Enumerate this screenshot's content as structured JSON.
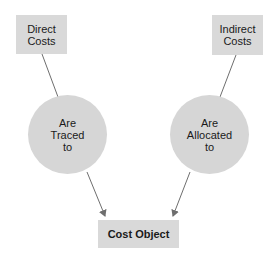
{
  "diagram": {
    "nodes": {
      "direct_costs": "Direct\nCosts",
      "indirect_costs": "Indirect\nCosts",
      "traced": "Are\nTraced\nto",
      "allocated": "Are\nAllocated\nto",
      "cost_object": "Cost Object"
    },
    "edges": [
      {
        "from": "Direct Costs",
        "via": "Are Traced to",
        "to": "Cost Object"
      },
      {
        "from": "Indirect Costs",
        "via": "Are Allocated to",
        "to": "Cost Object"
      }
    ],
    "colors": {
      "fill": "#d9d9d9",
      "line": "#6e6e6e",
      "text": "#1a1a1a"
    }
  }
}
